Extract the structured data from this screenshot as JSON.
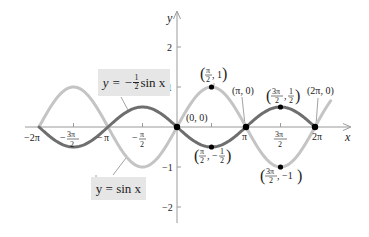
{
  "chart_data": {
    "type": "line",
    "title": "",
    "xlabel": "x",
    "ylabel": "y",
    "xlim_radians": [
      -6.283,
      7.0
    ],
    "ylim": [
      -2.5,
      2.5
    ],
    "grid": false,
    "x_ticks": [
      {
        "value_radians": -6.2832,
        "label": "−2π"
      },
      {
        "value_radians": -4.7124,
        "label": "−3π/2"
      },
      {
        "value_radians": -3.1416,
        "label": "−π"
      },
      {
        "value_radians": -1.5708,
        "label": "−π/2"
      },
      {
        "value_radians": 3.1416,
        "label": "π"
      },
      {
        "value_radians": 4.7124,
        "label": "3π/2"
      },
      {
        "value_radians": 6.2832,
        "label": "2π"
      }
    ],
    "y_ticks": [
      {
        "value": 2,
        "label": "2"
      },
      {
        "value": 1,
        "label": "1"
      },
      {
        "value": -1,
        "label": "−1"
      },
      {
        "value": -2,
        "label": "−2"
      }
    ],
    "series": [
      {
        "name": "y = sin x",
        "expression": "sin(x)",
        "x_range": [
          -6.283,
          7.0
        ],
        "color": "#c4c4c4",
        "width": 3
      },
      {
        "name": "y = −(1/2) sin x",
        "expression": "-0.5*sin(x)",
        "x_range": [
          -6.283,
          6.283
        ],
        "color": "#6e6e6e",
        "width": 3
      }
    ],
    "points": [
      {
        "x": 0,
        "y": 0,
        "label": "(0, 0)"
      },
      {
        "x": 1.5708,
        "y": 1,
        "label": "(π/2, 1)"
      },
      {
        "x": 1.5708,
        "y": -0.5,
        "label": "(π/2, −1/2)"
      },
      {
        "x": 3.1416,
        "y": 0,
        "label": "(π, 0)"
      },
      {
        "x": 4.7124,
        "y": 0.5,
        "label": "(3π/2, 1/2)"
      },
      {
        "x": 4.7124,
        "y": -1,
        "label": "(3π/2, −1)"
      },
      {
        "x": 6.2832,
        "y": 0,
        "label": "(2π, 0)"
      }
    ],
    "annotations": [
      {
        "text": "y = −(1/2) sin x",
        "target_series": 1
      },
      {
        "text": "y = sin x",
        "target_series": 0
      }
    ]
  },
  "labels": {
    "x_axis": "x",
    "y_axis": "y",
    "y2": "2",
    "y1": "1",
    "ym1": "−1",
    "ym2": "−2",
    "neg_two_pi": "−2π",
    "neg_three_pi_over_2_num": "3π",
    "neg_three_pi_over_2_den": "2",
    "minus": "−",
    "neg_pi": "π",
    "neg_pi_over_2_num": "π",
    "neg_pi_over_2_den": "2",
    "pi": "π",
    "three_pi_over_2_num": "3π",
    "three_pi_over_2_den": "2",
    "two_pi": "2π",
    "pt_origin": "(0, 0)",
    "pt_pi": "(π, 0)",
    "pt_2pi": "(2π, 0)",
    "pt_pi2_1_num": "π",
    "pt_pi2_1_den": "2",
    "pt_pi2_1_y": ", 1",
    "pt_3pi2_half_num": "3π",
    "pt_3pi2_half_den": "2",
    "pt_3pi2_half_ynum": "1",
    "pt_3pi2_half_yden": "2",
    "pt_pi2_mhalf_num": "π",
    "pt_pi2_mhalf_den": "2",
    "pt_pi2_mhalf_ynum": "1",
    "pt_pi2_mhalf_yden": "2",
    "pt_3pi2_m1_num": "3π",
    "pt_3pi2_m1_den": "2",
    "pt_3pi2_m1_y": ", −1"
  },
  "legend_boxes": {
    "neg_half": {
      "prefix": "y = −",
      "num": "1",
      "den": "2",
      "suffix": " sin x"
    },
    "sin": {
      "text": "y = sin x"
    }
  },
  "colors": {
    "sin_curve": "#c4c4c4",
    "neg_half_curve": "#6e6e6e",
    "axis": "#9a9a9a",
    "box_bg": "#e6e6e6"
  }
}
